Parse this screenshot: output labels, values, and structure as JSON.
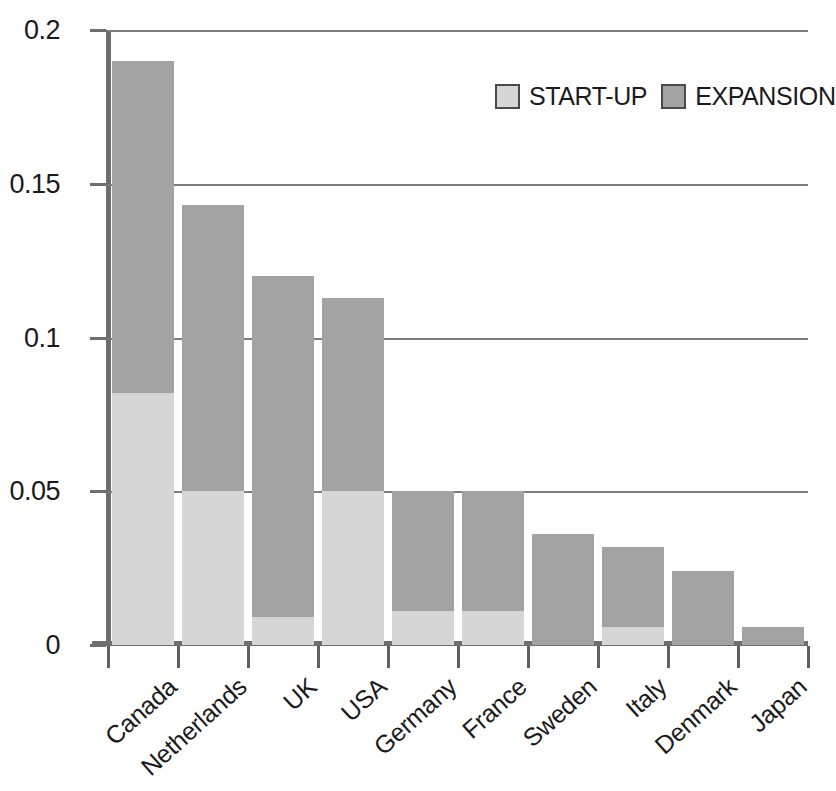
{
  "chart_data": {
    "type": "bar",
    "subtype": "stacked-bar",
    "title": "",
    "xlabel": "",
    "ylabel": "",
    "categories": [
      "Canada",
      "Netherlands",
      "UK",
      "USA",
      "Germany",
      "France",
      "Sweden",
      "Italy",
      "Denmark",
      "Japan"
    ],
    "series": [
      {
        "name": "START-UP",
        "color": "#d6d6d6",
        "values": [
          0.082,
          0.05,
          0.009,
          0.05,
          0.011,
          0.011,
          0.0,
          0.006,
          0.0,
          0.0
        ]
      },
      {
        "name": "EXPANSION",
        "color": "#a3a3a3",
        "values": [
          0.108,
          0.093,
          0.111,
          0.063,
          0.039,
          0.039,
          0.036,
          0.026,
          0.024,
          0.006
        ]
      }
    ],
    "totals": [
      0.19,
      0.143,
      0.12,
      0.113,
      0.05,
      0.05,
      0.036,
      0.032,
      0.024,
      0.006
    ],
    "ylim": [
      0,
      0.2
    ],
    "ytick_values": [
      0,
      0.05,
      0.1,
      0.15,
      0.2
    ],
    "ytick_labels": [
      "0",
      "0.05",
      "0.1",
      "0.15",
      "0.2"
    ],
    "grid": "horizontal",
    "legend_position": "top-right"
  },
  "legend": {
    "items": [
      {
        "label": "START-UP",
        "color": "#d6d6d6"
      },
      {
        "label": "EXPANSION",
        "color": "#a3a3a3"
      }
    ]
  },
  "colors": {
    "startup": "#d6d6d6",
    "expansion": "#a3a3a3",
    "axis": "#6e6e6e",
    "grid": "#7d7d7d",
    "text": "#1b1b1b",
    "background": "#ffffff"
  }
}
